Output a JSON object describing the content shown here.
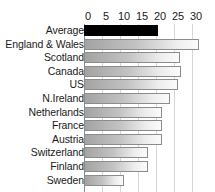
{
  "chart_data": {
    "type": "bar",
    "orientation": "horizontal",
    "title": "",
    "subtitle": "",
    "xlabel": "",
    "ylabel": "",
    "xlim": [
      0,
      32.5
    ],
    "xticks": [
      0,
      5,
      10,
      15,
      20,
      25,
      30
    ],
    "xtick_labels": [
      "0",
      "5",
      "10",
      "15",
      "20",
      "25",
      "30"
    ],
    "grid": true,
    "grid_axis": "x",
    "legend": false,
    "legend_position": "none",
    "categories": [
      "Average",
      "England & Wales",
      "Scotland",
      "Canada",
      "US",
      "N.Ireland",
      "Netherlands",
      "France",
      "Austria",
      "Switzerland",
      "Finland",
      "Sweden"
    ],
    "values": [
      20.5,
      32.0,
      26.7,
      27.0,
      26.0,
      24.0,
      21.7,
      21.7,
      21.7,
      17.8,
      17.8,
      11.0
    ],
    "highlight_category": "Average",
    "highlight_color": "#000000",
    "bar_fill_start": "#a3a3a3",
    "bar_fill_end": "#fbfbfb",
    "bar_border_color": "#8c8c8c",
    "grid_color": "#d6d6d6",
    "axis_color": "#888888",
    "text_color": "#1a1a1a",
    "background_color": "#ffffff"
  }
}
